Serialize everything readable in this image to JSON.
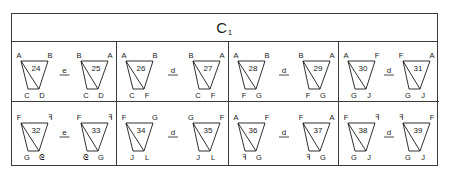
{
  "title": {
    "main": "C",
    "subscript": "1"
  },
  "colors": {
    "line": "#1a1a1a",
    "border": "#3a3a3a",
    "background": "#ffffff"
  },
  "cells": [
    {
      "row": 0,
      "col": 0,
      "relation": "e",
      "left": {
        "number": "24",
        "top": [
          "A",
          "B"
        ],
        "bottom": [
          "C",
          "D"
        ]
      },
      "right": {
        "number": "25",
        "top": [
          "B",
          "A"
        ],
        "bottom": [
          "C",
          "D"
        ]
      }
    },
    {
      "row": 0,
      "col": 1,
      "relation": "d",
      "left": {
        "number": "26",
        "top": [
          "A",
          "B"
        ],
        "bottom": [
          "C",
          "F"
        ]
      },
      "right": {
        "number": "27",
        "top": [
          "B",
          "A"
        ],
        "bottom": [
          "C",
          "F"
        ]
      }
    },
    {
      "row": 0,
      "col": 2,
      "relation": "d",
      "left": {
        "number": "28",
        "top": [
          "A",
          "B"
        ],
        "bottom": [
          "F",
          "G"
        ]
      },
      "right": {
        "number": "29",
        "top": [
          "B",
          "A"
        ],
        "bottom": [
          "F",
          "G"
        ]
      }
    },
    {
      "row": 0,
      "col": 3,
      "relation": "d",
      "left": {
        "number": "30",
        "top": [
          "A",
          "F"
        ],
        "bottom": [
          "G",
          "J"
        ]
      },
      "right": {
        "number": "31",
        "top": [
          "F",
          "A"
        ],
        "bottom": [
          "G",
          "J"
        ]
      }
    },
    {
      "row": 1,
      "col": 0,
      "relation": "e",
      "left": {
        "number": "32",
        "top": [
          "F",
          "ꟻ"
        ],
        "bottom": [
          "G",
          "ᘓ"
        ]
      },
      "right": {
        "number": "33",
        "top": [
          "F",
          "ꟻ"
        ],
        "bottom": [
          "ᘓ",
          "G"
        ]
      }
    },
    {
      "row": 1,
      "col": 1,
      "relation": "d",
      "left": {
        "number": "34",
        "top": [
          "F",
          "G"
        ],
        "bottom": [
          "J",
          "L"
        ]
      },
      "right": {
        "number": "35",
        "top": [
          "G",
          "F"
        ],
        "bottom": [
          "J",
          "L"
        ]
      }
    },
    {
      "row": 1,
      "col": 2,
      "relation": "d",
      "left": {
        "number": "36",
        "top": [
          "A",
          "F"
        ],
        "bottom": [
          "ꟻ",
          "G"
        ]
      },
      "right": {
        "number": "37",
        "top": [
          "F",
          "A"
        ],
        "bottom": [
          "ꟻ",
          "G"
        ]
      }
    },
    {
      "row": 1,
      "col": 3,
      "relation": "d",
      "left": {
        "number": "38",
        "top": [
          "F",
          "ꟻ"
        ],
        "bottom": [
          "G",
          "J"
        ]
      },
      "right": {
        "number": "39",
        "top": [
          "ꟻ",
          "F"
        ],
        "bottom": [
          "G",
          "J"
        ]
      }
    }
  ]
}
